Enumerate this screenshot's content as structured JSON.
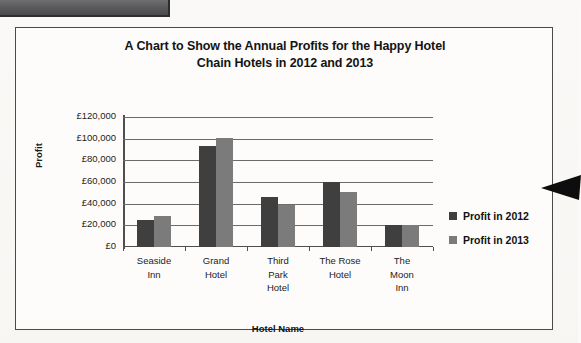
{
  "document": {
    "top_band_label": "",
    "annotation_arrow": "left-pointing-arrow"
  },
  "chart_data": {
    "type": "bar",
    "title": "A Chart to Show the Annual Profits for the Happy Hotel Chain Hotels in 2012 and 2013",
    "title_line1": "A Chart to Show the Annual Profits for the Happy Hotel",
    "title_line2": "Chain Hotels in 2012 and 2013",
    "xlabel": "Hotel Name",
    "ylabel": "Profit",
    "categories": [
      "Seaside Inn",
      "Grand Hotel",
      "Third Park Hotel",
      "The Rose Hotel",
      "The Moon Inn"
    ],
    "category_lines": [
      [
        "Seaside",
        "Inn"
      ],
      [
        "Grand",
        "Hotel"
      ],
      [
        "Third",
        "Park",
        "Hotel"
      ],
      [
        "The Rose",
        "Hotel"
      ],
      [
        "The",
        "Moon",
        "Inn"
      ]
    ],
    "series": [
      {
        "name": "Profit in 2012",
        "color": "#3f3f3f",
        "values": [
          25000,
          93000,
          46000,
          60000,
          20000
        ]
      },
      {
        "name": "Profit in 2013",
        "color": "#7b7b7b",
        "values": [
          29000,
          101000,
          39000,
          51000,
          20000
        ]
      }
    ],
    "ylim": [
      0,
      120000
    ],
    "ytick_values": [
      0,
      20000,
      40000,
      60000,
      80000,
      100000,
      120000
    ],
    "ytick_labels": [
      "£0",
      "£20,000",
      "£40,000",
      "£60,000",
      "£80,000",
      "£100,000",
      "£120,000"
    ],
    "grid": true,
    "grid_axis": "y",
    "legend_position": "right",
    "currency_symbol": "£"
  }
}
